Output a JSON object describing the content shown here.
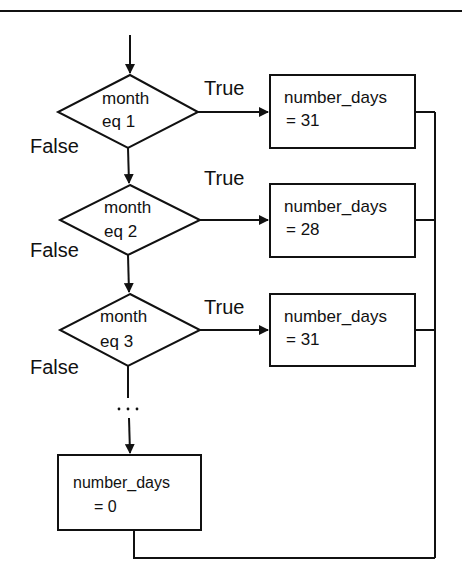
{
  "diagram": {
    "type": "flowchart",
    "decisions": [
      {
        "line1": "month",
        "line2": "eq 1",
        "true_label": "True",
        "false_label": "False"
      },
      {
        "line1": "month",
        "line2": "eq 2",
        "true_label": "True",
        "false_label": "False"
      },
      {
        "line1": "month",
        "line2": "eq 3",
        "true_label": "True",
        "false_label": "False"
      }
    ],
    "actions": [
      {
        "line1": "number_days",
        "line2": "=  31"
      },
      {
        "line1": "number_days",
        "line2": "=  28"
      },
      {
        "line1": "number_days",
        "line2": "=  31"
      }
    ],
    "continuation": "...",
    "default_action": {
      "line1": "number_days",
      "line2": "= 0"
    },
    "colors": {
      "stroke": "#111111",
      "background": "#ffffff"
    }
  }
}
